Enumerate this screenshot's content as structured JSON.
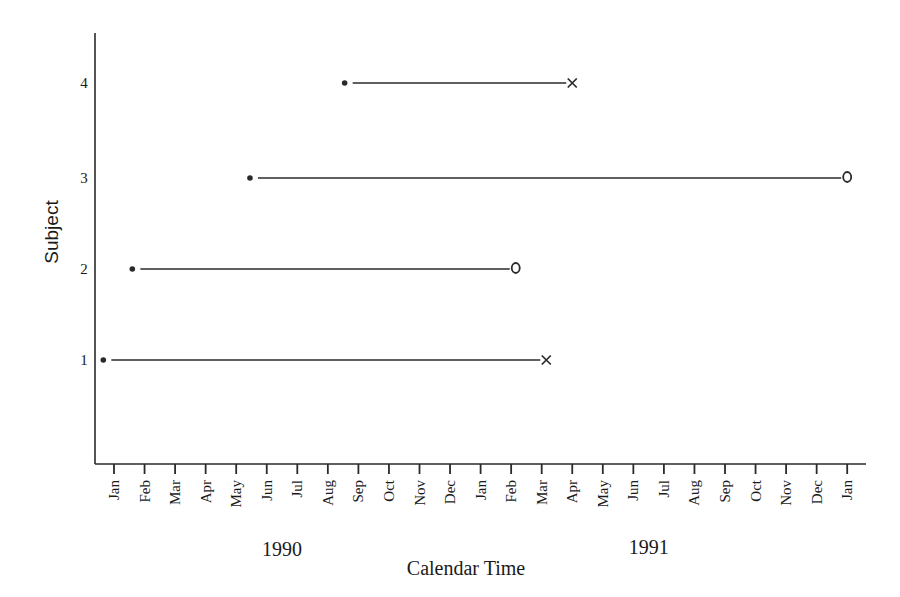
{
  "chart_data": {
    "type": "timeline",
    "title": "",
    "xlabel": "Calendar Time",
    "ylabel": "Subject",
    "x_tick_labels": [
      "Jan",
      "Feb",
      "Mar",
      "Apr",
      "May",
      "Jun",
      "Jul",
      "Aug",
      "Sep",
      "Oct",
      "Nov",
      "Dec",
      "Jan",
      "Feb",
      "Mar",
      "Apr",
      "May",
      "Jun",
      "Jul",
      "Aug",
      "Sep",
      "Oct",
      "Nov",
      "Dec",
      "Jan"
    ],
    "year_labels": [
      {
        "label": "1990",
        "month_index": 5.5
      },
      {
        "label": "1991",
        "month_index": 17.5
      }
    ],
    "y_ticks": [
      1,
      2,
      3,
      4
    ],
    "ylim": [
      0,
      4.6
    ],
    "xlim_months_from_jan1990": [
      -0.6,
      24.6
    ],
    "legend": {
      "start": "• entry",
      "x": "event (failure)",
      "o": "censored"
    },
    "series": [
      {
        "subject": 1,
        "start_month": -0.35,
        "end_month": 14.15,
        "end_marker": "x",
        "start_approx": "Dec 1989",
        "end_approx": "Mar 1991"
      },
      {
        "subject": 2,
        "start_month": 0.6,
        "end_month": 13.15,
        "end_marker": "o",
        "start_approx": "Jan 1990",
        "end_approx": "Feb 1991"
      },
      {
        "subject": 3,
        "start_month": 4.45,
        "end_month": 24.0,
        "end_marker": "o",
        "start_approx": "May 1990",
        "end_approx": "Jan 1992"
      },
      {
        "subject": 4,
        "start_month": 7.55,
        "end_month": 15.0,
        "end_marker": "x",
        "start_approx": "Aug 1990",
        "end_approx": "Apr 1991"
      }
    ]
  },
  "layout": {
    "x0": 114,
    "px_per_month": 30.55,
    "axis_left": 95,
    "axis_top": 33,
    "axis_bottom": 464,
    "axis_right": 866,
    "subject_y": {
      "1": 360,
      "2": 269,
      "3": 178,
      "4": 83
    },
    "line_color": "#2a2a2a"
  }
}
